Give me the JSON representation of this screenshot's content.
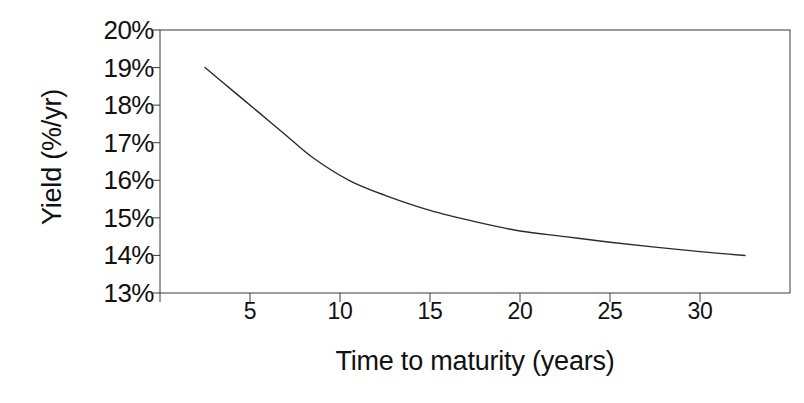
{
  "chart_data": {
    "type": "line",
    "title": "",
    "xlabel": "Time to maturity (years)",
    "ylabel": "Yield (%/yr)",
    "xlim": [
      0,
      35
    ],
    "ylim": [
      13,
      20
    ],
    "grid": false,
    "legend": null,
    "xticks": [
      5,
      10,
      15,
      20,
      25,
      30
    ],
    "xtick_labels": [
      "5",
      "10",
      "15",
      "20",
      "25",
      "30"
    ],
    "yticks": [
      13,
      14,
      15,
      16,
      17,
      18,
      19,
      20
    ],
    "ytick_labels": [
      "13%",
      "14%",
      "15%",
      "16%",
      "17%",
      "18%",
      "19%",
      "20%"
    ],
    "series": [
      {
        "name": "Yield curve",
        "color": "#2b2b2b",
        "line_width": 1.4,
        "x": [
          2.5,
          4,
          5.5,
          7,
          8.5,
          10.5,
          12.5,
          15,
          17.5,
          20,
          22.5,
          25,
          27.5,
          30,
          32.5
        ],
        "y": [
          19.0,
          18.4,
          17.8,
          17.2,
          16.6,
          16.0,
          15.6,
          15.2,
          14.9,
          14.65,
          14.5,
          14.35,
          14.22,
          14.1,
          14.0
        ]
      }
    ]
  },
  "axis": {
    "ylabel_text": "Yield (%/yr)",
    "xlabel_text": "Time to maturity (years)"
  },
  "frame": {
    "color": "#3a3a3a",
    "width": 1
  }
}
